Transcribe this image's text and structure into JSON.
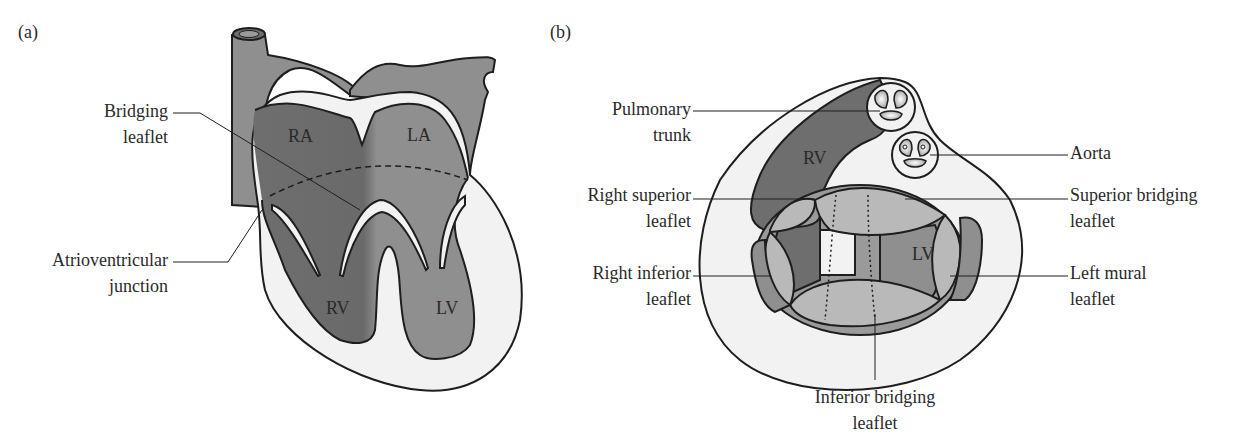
{
  "panel_a": {
    "tag": "(a)",
    "labels": {
      "bridging_leaflet": [
        "Bridging",
        "leaflet"
      ],
      "av_junction": [
        "Atrioventricular",
        "junction"
      ]
    },
    "chambers": {
      "ra": "RA",
      "la": "LA",
      "rv": "RV",
      "lv": "LV"
    }
  },
  "panel_b": {
    "tag": "(b)",
    "labels": {
      "pulmonary_trunk": [
        "Pulmonary",
        "trunk"
      ],
      "aorta": "Aorta",
      "right_superior": [
        "Right superior",
        "leaflet"
      ],
      "superior_bridging": [
        "Superior bridging",
        "leaflet"
      ],
      "right_inferior": [
        "Right inferior",
        "leaflet"
      ],
      "left_mural": [
        "Left mural",
        "leaflet"
      ],
      "inferior_bridging": [
        "Inferior bridging",
        "leaflet"
      ]
    },
    "chambers": {
      "rv": "RV",
      "lv": "LV"
    }
  },
  "colors": {
    "dark": "#6e6e6e",
    "mid": "#8f8f8f",
    "light": "#b9b9b9",
    "pale": "#f2f2f2",
    "outline": "#1e1e1e"
  }
}
